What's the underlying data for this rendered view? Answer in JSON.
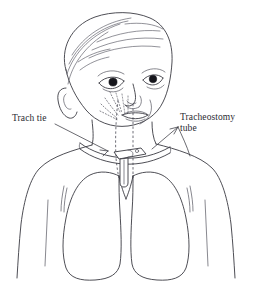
{
  "figure": {
    "type": "medical-line-illustration",
    "background_color": "#ffffff",
    "ink_color": "#3a3a42",
    "width": 255,
    "height": 289
  },
  "labels": {
    "trach_tie": "Trach tie",
    "tracheostomy_tube_line1": "Tracheostomy",
    "tracheostomy_tube_line2": "tube",
    "tracheostomy_tube": "Tracheostomy\ntube"
  },
  "anatomy": {
    "head": "infant-head",
    "hair": "hair-strands",
    "ear": "left-ear",
    "eye_left": "left-eye",
    "eye_right": "right-eye",
    "nose": "nose",
    "mouth": "mouth",
    "neck": "neck",
    "torso": "chest-and-shoulders",
    "lung_left": "left-lung",
    "lung_right": "right-lung",
    "trachea": "trachea-dashed-airway",
    "carina": "carina-bifurcation"
  },
  "device": {
    "trach_tie_band": "neck-tie-band",
    "tube_flange": "tracheostomy-tube-flange",
    "tube_shaft": "tracheostomy-tube-shaft"
  }
}
